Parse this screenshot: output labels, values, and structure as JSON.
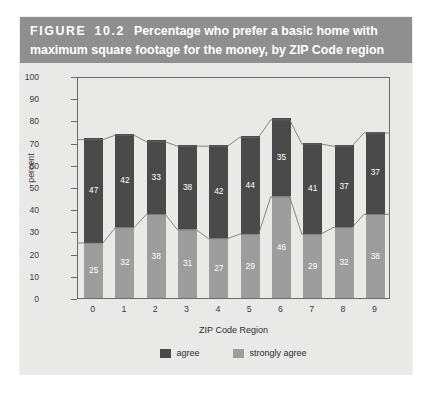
{
  "figure": {
    "label_word": "FIGURE",
    "number": "10.2",
    "title_rest": "Percentage who prefer a basic home with",
    "title_line2": "maximum square footage for the money, by ZIP Code region",
    "band_color": "#8f8f8f",
    "panel_color": "#e9e9e7"
  },
  "chart_data": {
    "type": "bar",
    "subtype": "stacked-bar",
    "title": "Percentage who prefer a basic home with maximum square footage for the money, by ZIP Code region",
    "xlabel": "ZIP Code Region",
    "ylabel": "percent",
    "ylim": [
      0,
      100
    ],
    "ytick_step": 10,
    "yticks": [
      0,
      10,
      20,
      30,
      40,
      50,
      60,
      70,
      80,
      90,
      100
    ],
    "categories": [
      "0",
      "1",
      "2",
      "3",
      "4",
      "5",
      "6",
      "7",
      "8",
      "9"
    ],
    "grid": false,
    "legend_position": "bottom-center",
    "series": [
      {
        "name": "strongly agree",
        "color": "#9d9d9d",
        "stack_order": "bottom",
        "values": [
          25,
          32,
          38,
          31,
          27,
          29,
          46,
          29,
          32,
          38
        ]
      },
      {
        "name": "agree",
        "color": "#4a4a4a",
        "stack_order": "top",
        "values": [
          47,
          42,
          33,
          38,
          42,
          44,
          35,
          41,
          37,
          37
        ]
      }
    ],
    "totals": [
      72,
      74,
      71,
      69,
      69,
      73,
      81,
      70,
      69,
      75
    ],
    "annotations": "Each bar segment is labeled in white with its percentage value; thin outline lines connect the tops of the bars and the tops of the 'strongly agree' segments across categories."
  },
  "legend": {
    "items": [
      {
        "label": "agree",
        "color": "#4a4a4a",
        "swatch": "agree"
      },
      {
        "label": "strongly agree",
        "color": "#9d9d9d",
        "swatch": "strong"
      }
    ]
  }
}
